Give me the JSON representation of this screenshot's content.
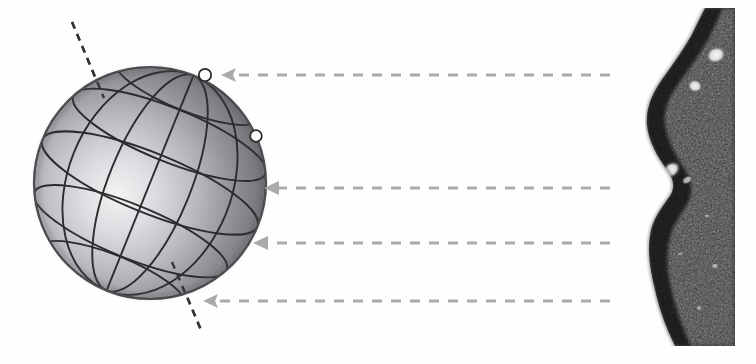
{
  "figure": {
    "title": "",
    "background_color": "#fefefe",
    "width": 756,
    "height": 364
  },
  "sphere": {
    "name": "gridded-sphere",
    "center_x": 150,
    "center_y": 183,
    "radius": 116,
    "fill_dark": "#6e7073",
    "fill_light": "#e9eaec",
    "highlight_x": 112,
    "highlight_y": 196,
    "outline_color": "#4a4c4f",
    "gridline_color": "#2b2c2e",
    "meridian_count": 4,
    "parallel_count": 4,
    "tilt_degrees": 22
  },
  "rotation_axis": {
    "name": "rotation-axis",
    "style": "dashed",
    "color": "#333436",
    "x1": 72,
    "y1": 22,
    "x2": 201,
    "y2": 330,
    "dash": "7 6",
    "width": 2.4
  },
  "markers": [
    {
      "label": "marker-upper",
      "cx": 205,
      "cy": 75,
      "r": 6.2,
      "fill": "#ffffff",
      "stroke": "#2b2c2e"
    },
    {
      "label": "marker-lower",
      "cx": 256,
      "cy": 136,
      "r": 5.8,
      "fill": "#ffffff",
      "stroke": "#2b2c2e"
    }
  ],
  "arrows": [
    {
      "label": "arrow-1",
      "y": 75,
      "x_tail": 610,
      "x_head": 221,
      "head_style": "open",
      "color": "#a9aaac"
    },
    {
      "label": "arrow-2",
      "y": 188,
      "x_tail": 610,
      "x_head": 264,
      "head_style": "solid",
      "color": "#a9aaac"
    },
    {
      "label": "arrow-3",
      "y": 243,
      "x_tail": 610,
      "x_head": 253,
      "head_style": "solid",
      "color": "#a9aaac"
    },
    {
      "label": "arrow-4",
      "y": 301,
      "x_tail": 610,
      "x_head": 203,
      "head_style": "open",
      "color": "#a9aaac"
    }
  ],
  "arrow_style": {
    "dash": "10 9",
    "stroke_width": 3.2,
    "head_length": 13,
    "head_half_height": 7
  },
  "tissue_image": {
    "name": "tissue-micrograph",
    "left": 645,
    "top": 8,
    "width": 90,
    "height": 338,
    "dark_color": "#2a2a2a",
    "mid_color": "#4a4a4a",
    "bright_color": "#f2f2f2",
    "edge_color": "#161616",
    "description": "dark mottled tissue cross-section with bright speckles along a convex left margin"
  }
}
